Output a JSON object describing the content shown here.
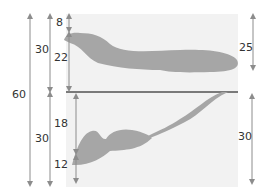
{
  "diagram": {
    "panel_color": "#f2f2f2",
    "shape_color": "#a6a6a6",
    "divider_color": "#7a7a7a",
    "arrow_color": "#8c8c8c",
    "text_color": "#333333",
    "top_panel": {
      "label": "upper region",
      "dimensions": {
        "gap_top": "8",
        "shape_depth": "22",
        "right_depth": "25"
      }
    },
    "bottom_panel": {
      "label": "lower region",
      "dimensions": {
        "upper_part": "18",
        "lower_part": "12",
        "right_height": "30"
      }
    },
    "outer_dimensions": {
      "total": "60",
      "top_half": "30",
      "bottom_half": "30"
    }
  }
}
